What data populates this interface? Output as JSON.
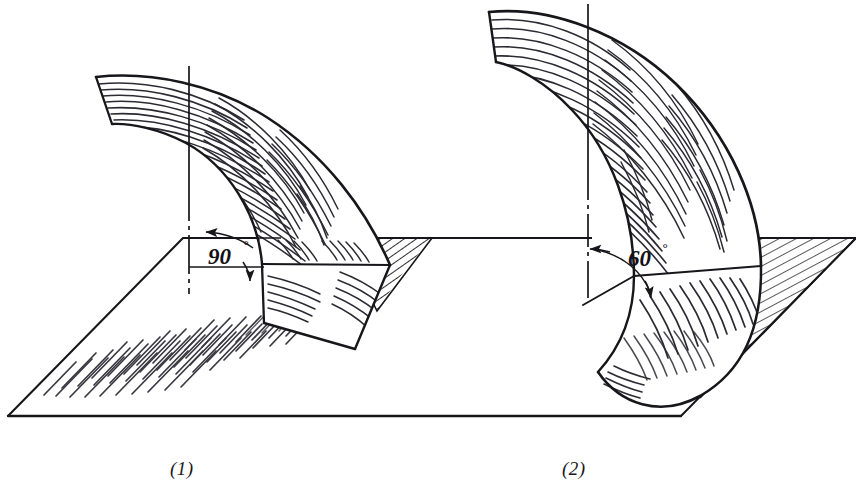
{
  "document": {
    "type": "technical-line-drawing",
    "title": "Curved ruled surfaces meeting a horizontal plane",
    "background_color": "#ffffff",
    "ink_color": "#17161a"
  },
  "figures": [
    {
      "id": "figure-1",
      "caption": "(1)",
      "angle_label": "90",
      "degree_symbol": "°",
      "angle_value": 90,
      "description": "Curved warped surface intersecting the horizontal plane at ninety degrees",
      "axis_type": "dash-dot centerline",
      "has_ground_plane": true,
      "hatching": "radial-striped-shading"
    },
    {
      "id": "figure-2",
      "caption": "(2)",
      "angle_label": "60",
      "degree_symbol": "°",
      "angle_value": 60,
      "description": "Curved warped surface intersecting the horizontal plane at sixty degrees",
      "axis_type": "dash-dot centerline",
      "has_ground_plane": true,
      "hatching": "radial-striped-shading"
    }
  ],
  "ground_plane": {
    "label": "horizontal reference plane",
    "hatch_regions": [
      "left-foreground-patch",
      "figure-1-right-wedge",
      "figure-2-right-wedge"
    ]
  },
  "annotations": {
    "arrow_style": "thin leader with solid arrowhead",
    "arc_style": "thin arc with arrowheads at both ends"
  }
}
